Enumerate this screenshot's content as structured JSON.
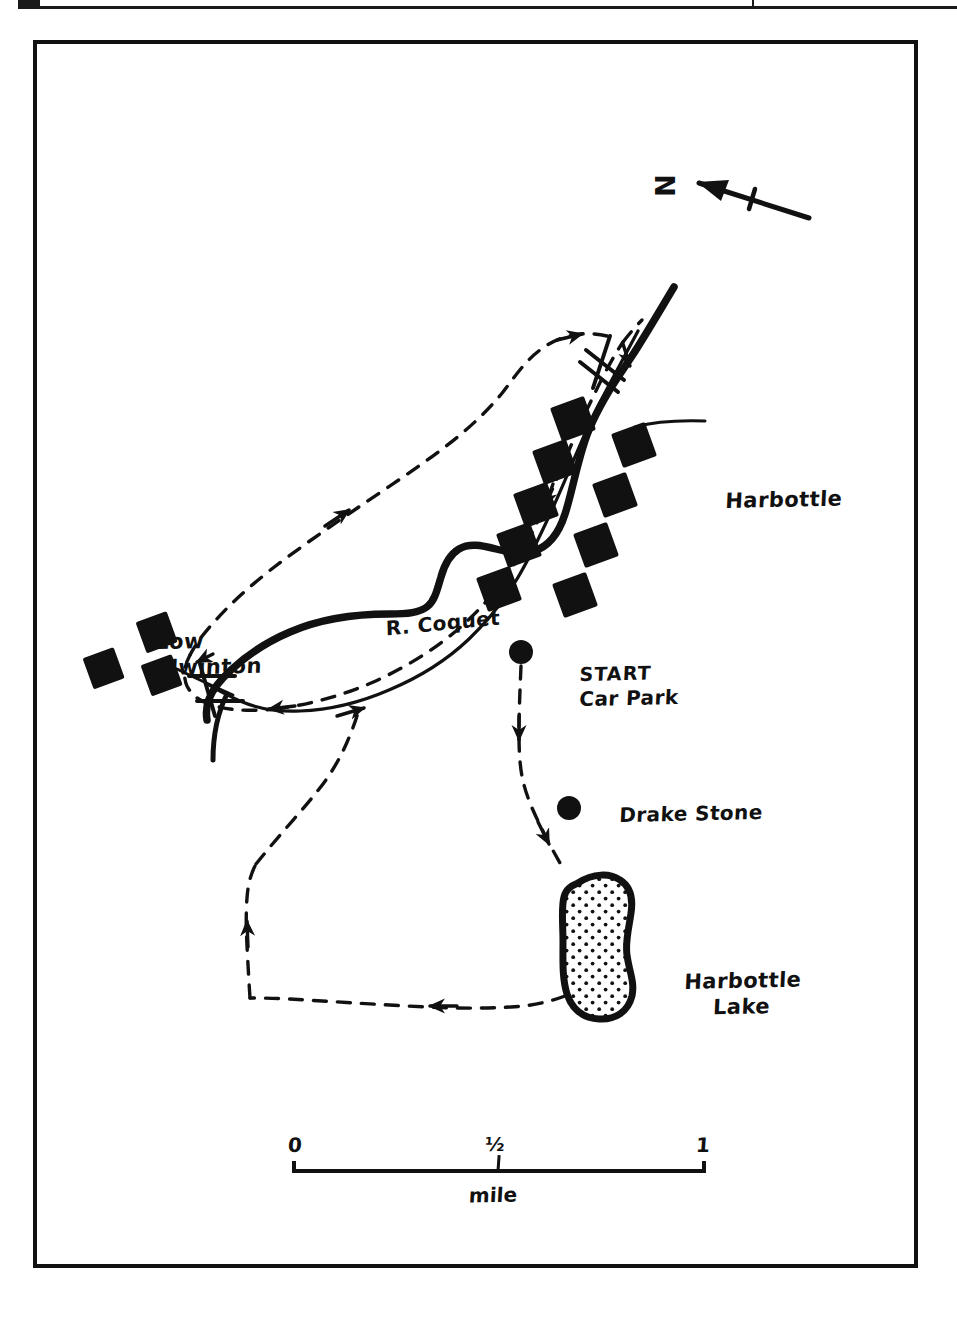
{
  "page": {
    "top_rule_present": true
  },
  "map": {
    "title": "Harbottle circular walk sketch map",
    "ink_color": "#111111",
    "background_color": "#ffffff",
    "north_arrow": {
      "letter": "N",
      "direction": "points up-left (north-west on page)"
    },
    "labels": {
      "harbottle": "Harbottle",
      "low_alwinton": "Low\nAlwinton",
      "river": "R. Coquet",
      "start": "START",
      "car_park": "Car Park",
      "drake_stone": "Drake Stone",
      "harbottle_lake": "Harbottle\nLake"
    },
    "markers": [
      {
        "name": "start-car-park-marker",
        "type": "filled-dot",
        "cx": 484,
        "cy": 608,
        "r": 11
      },
      {
        "name": "drake-stone-marker",
        "type": "filled-dot",
        "cx": 532,
        "cy": 764,
        "r": 11
      }
    ],
    "buildings": {
      "low_alwinton_count": 3,
      "harbottle_count": 9,
      "style": "solid black squares rotated ~20 degrees"
    },
    "features": [
      {
        "name": "river-coquet",
        "style": "solid thick line"
      },
      {
        "name": "road",
        "style": "solid thin line"
      },
      {
        "name": "walk-route",
        "style": "dashed line with direction arrows"
      },
      {
        "name": "harbottle-lake",
        "style": "thick outline with stippled dot fill"
      },
      {
        "name": "bridge",
        "count": 2,
        "style": "hatched crossing marks over river"
      }
    ],
    "scale": {
      "ticks": [
        "0",
        "½",
        "1"
      ],
      "unit": "mile"
    }
  }
}
